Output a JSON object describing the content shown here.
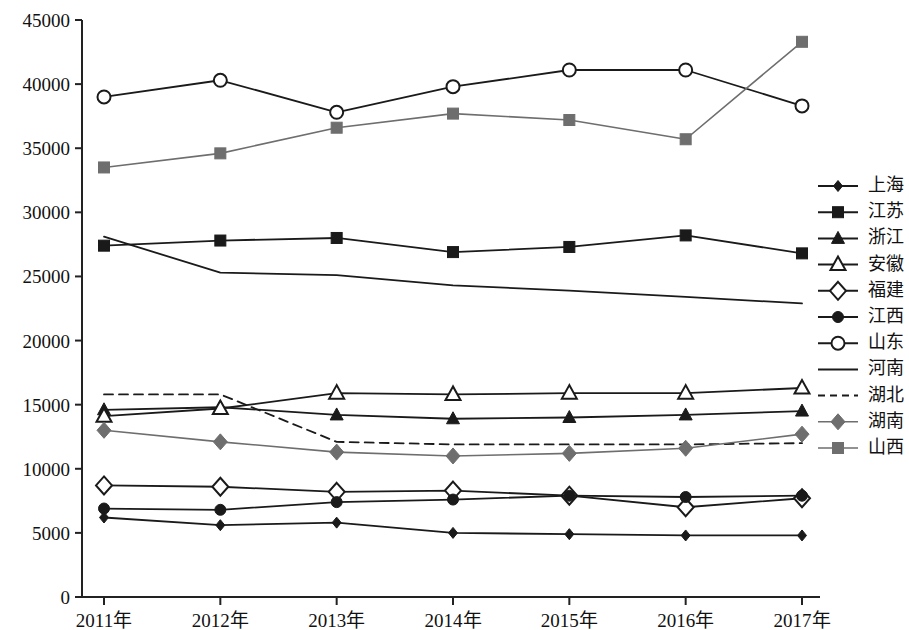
{
  "chart_data": {
    "type": "line",
    "title": "",
    "subtitle": "",
    "xlabel": "",
    "ylabel": "",
    "grid": false,
    "legend_position": "right",
    "ylim": [
      0,
      45000
    ],
    "ytick_step": 5000,
    "ytick_labels": [
      "0",
      "5000",
      "10000",
      "15000",
      "20000",
      "25000",
      "30000",
      "35000",
      "40000",
      "45000"
    ],
    "ytick_values": [
      0,
      5000,
      10000,
      15000,
      20000,
      25000,
      30000,
      35000,
      40000,
      45000
    ],
    "categories": [
      "2011年",
      "2012年",
      "2013年",
      "2014年",
      "2015年",
      "2016年",
      "2017年"
    ],
    "x": [
      2011,
      2012,
      2013,
      2014,
      2015,
      2016,
      2017
    ],
    "series": [
      {
        "name": "上海",
        "marker": "filled-diamond-small",
        "line": "solid",
        "color": "#1a1a1a",
        "values": [
          6200,
          5600,
          5800,
          5000,
          4900,
          4800,
          4800
        ]
      },
      {
        "name": "江苏",
        "marker": "filled-square",
        "line": "solid",
        "color": "#1a1a1a",
        "values": [
          27400,
          27800,
          28000,
          26900,
          27300,
          28200,
          26800
        ]
      },
      {
        "name": "浙江",
        "marker": "filled-triangle",
        "line": "solid",
        "color": "#1a1a1a",
        "values": [
          14600,
          14800,
          14200,
          13900,
          14000,
          14200,
          14500
        ]
      },
      {
        "name": "安徽",
        "marker": "open-triangle",
        "line": "solid",
        "color": "#1a1a1a",
        "values": [
          14100,
          14700,
          15900,
          15800,
          15900,
          15900,
          16300
        ]
      },
      {
        "name": "福建",
        "marker": "open-diamond",
        "line": "solid",
        "color": "#1a1a1a",
        "values": [
          8700,
          8600,
          8200,
          8300,
          7900,
          7000,
          7700
        ]
      },
      {
        "name": "江西",
        "marker": "filled-circle",
        "line": "solid",
        "color": "#1a1a1a",
        "values": [
          6900,
          6800,
          7400,
          7600,
          7900,
          7800,
          7900
        ]
      },
      {
        "name": "山东",
        "marker": "open-circle",
        "line": "solid",
        "color": "#1a1a1a",
        "values": [
          39000,
          40300,
          37800,
          39800,
          41100,
          41100,
          38300
        ]
      },
      {
        "name": "河南",
        "marker": "none",
        "line": "solid",
        "color": "#1a1a1a",
        "values": [
          28100,
          25300,
          25100,
          24300,
          23900,
          23400,
          22900
        ]
      },
      {
        "name": "湖北",
        "marker": "none",
        "line": "dashed",
        "color": "#1a1a1a",
        "values": [
          15800,
          15800,
          12100,
          11900,
          11900,
          11900,
          12000
        ]
      },
      {
        "name": "湖南",
        "marker": "filled-diamond-gray",
        "line": "solid",
        "color": "#6e6e6e",
        "values": [
          13000,
          12100,
          11300,
          11000,
          11200,
          11600,
          12700
        ]
      },
      {
        "name": "山西",
        "marker": "filled-square-gray",
        "line": "solid",
        "color": "#6e6e6e",
        "values": [
          33500,
          34600,
          36600,
          37700,
          37200,
          35700,
          43300
        ]
      }
    ]
  },
  "legend": {
    "items": [
      {
        "label": "上海"
      },
      {
        "label": "江苏"
      },
      {
        "label": "浙江"
      },
      {
        "label": "安徽"
      },
      {
        "label": "福建"
      },
      {
        "label": "江西"
      },
      {
        "label": "山东"
      },
      {
        "label": "河南"
      },
      {
        "label": "湖北"
      },
      {
        "label": "湖南"
      },
      {
        "label": "山西"
      }
    ]
  },
  "colors": {
    "axis": "#222222",
    "primary_series": "#1a1a1a",
    "gray_series": "#6e6e6e",
    "background": "#ffffff"
  }
}
